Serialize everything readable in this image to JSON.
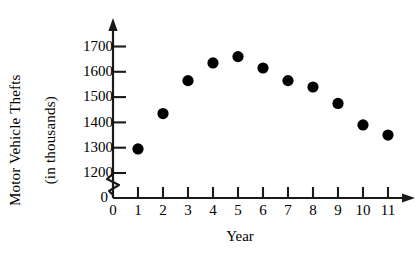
{
  "chart_data": {
    "type": "scatter",
    "title": "",
    "xlabel": "Year",
    "ylabel": "Motor Vehicle Thefts (in thousands)",
    "ylabel_line1": "Motor Vehicle Thefts",
    "ylabel_line2": "(in thousands)",
    "x": [
      1,
      2,
      3,
      4,
      5,
      6,
      7,
      8,
      9,
      10,
      11
    ],
    "values": [
      1295,
      1435,
      1565,
      1635,
      1660,
      1615,
      1565,
      1540,
      1475,
      1390,
      1350
    ],
    "series": [
      {
        "name": "Motor Vehicle Thefts",
        "values": [
          1295,
          1435,
          1565,
          1635,
          1660,
          1615,
          1565,
          1540,
          1475,
          1390,
          1350
        ]
      }
    ],
    "xtick_labels": [
      "0",
      "1",
      "2",
      "3",
      "4",
      "5",
      "6",
      "7",
      "8",
      "9",
      "10",
      "11"
    ],
    "xtick_values": [
      0,
      1,
      2,
      3,
      4,
      5,
      6,
      7,
      8,
      9,
      10,
      11
    ],
    "ytick_labels": [
      "1200",
      "1300",
      "1400",
      "1500",
      "1600",
      "1700"
    ],
    "ytick_values": [
      1200,
      1300,
      1400,
      1500,
      1600,
      1700
    ],
    "y_origin_label": "0",
    "xlim": [
      0,
      11.8
    ],
    "ylim": [
      1200,
      1700
    ],
    "grid": false,
    "legend": false,
    "axis_break_y": true,
    "marker": "filled-circle",
    "marker_color": "#000000",
    "marker_size_px": 5.6,
    "axis_color": "#1a1a1a",
    "background_color": "#ffffff"
  }
}
